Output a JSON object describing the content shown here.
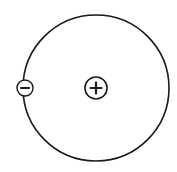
{
  "diagram": {
    "type": "atom-model",
    "background": "#ffffff",
    "stroke_color": "#1a1a1a",
    "orbit": {
      "cx": 96,
      "cy": 88,
      "r": 73,
      "stroke_width": 1.6
    },
    "nucleus": {
      "cx": 96,
      "cy": 88,
      "r": 11,
      "symbol": "+",
      "label": "proton"
    },
    "electron": {
      "cx": 25,
      "cy": 88,
      "r": 8,
      "symbol": "−",
      "label": "electron"
    }
  }
}
